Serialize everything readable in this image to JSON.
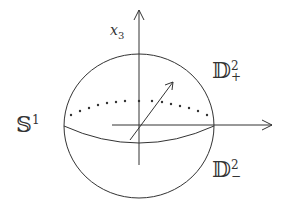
{
  "labels": {
    "axis": "x",
    "axis_sub": "3",
    "circle": "𝕊",
    "circle_sup": "1",
    "upper_disk": "𝔻",
    "upper_sup": "2",
    "upper_sub": "+",
    "lower_disk": "𝔻",
    "lower_sup": "2",
    "lower_sub": "−"
  }
}
